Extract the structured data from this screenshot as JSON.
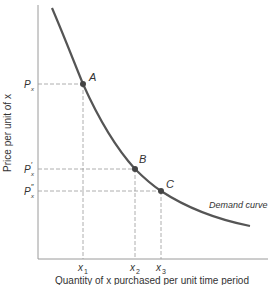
{
  "diagram": {
    "type": "demand-curve",
    "axes": {
      "ylabel": "Price per unit of x",
      "xlabel": "Quantity of x purchased per unit time period"
    },
    "points": [
      {
        "name": "A",
        "price_label": "P",
        "price_sub": "x",
        "price_prime": "",
        "qty_label": "x",
        "qty_sub": "1"
      },
      {
        "name": "B",
        "price_label": "P",
        "price_sub": "x",
        "price_prime": "′",
        "qty_label": "x",
        "qty_sub": "2"
      },
      {
        "name": "C",
        "price_label": "P",
        "price_sub": "x",
        "price_prime": "″",
        "qty_label": "x",
        "qty_sub": "3"
      }
    ],
    "curve_label": "Demand curve",
    "colors": {
      "curve": "#555555",
      "axis": "#888888",
      "guide": "#999999"
    }
  }
}
